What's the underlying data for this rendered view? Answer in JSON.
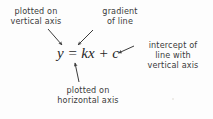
{
  "diagram": {
    "equation": {
      "text": "y = kx + c",
      "color": "#262626"
    },
    "text_color": "#3b3b3b",
    "background_color": "#fdfdfd",
    "labels": {
      "vertical_axis": {
        "line1": "plotted on",
        "line2": "vertical axis",
        "target": "y"
      },
      "gradient": {
        "line1": "gradient",
        "line2": "of line",
        "target": "k"
      },
      "intercept": {
        "line1": "intercept of",
        "line2": "line with",
        "line3": "vertical axis",
        "target": "c"
      },
      "horizontal_axis": {
        "line1": "plotted on",
        "line2": "horizontal axis",
        "target": "x"
      }
    },
    "arrows": [
      {
        "name": "arrow-to-y",
        "from": [
          48,
          29
        ],
        "to": [
          62,
          45
        ]
      },
      {
        "name": "arrow-to-k",
        "from": [
          93,
          30
        ],
        "to": [
          78,
          45
        ]
      },
      {
        "name": "arrow-to-c",
        "from": [
          134,
          46
        ],
        "to": [
          118,
          53
        ]
      },
      {
        "name": "arrow-to-x",
        "from": [
          79,
          82
        ],
        "to": [
          75,
          63
        ]
      }
    ]
  }
}
